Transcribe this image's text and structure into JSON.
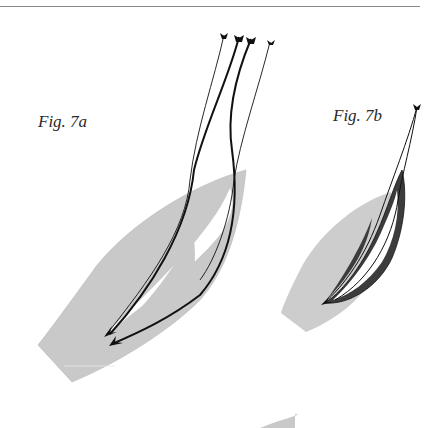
{
  "page": {
    "figures": [
      {
        "id": "7a",
        "label": "Fig. 7a",
        "description": "Boat hull outline (grey) with sail sheets/telltales shown as four curved lines with arrowheads"
      },
      {
        "id": "7b",
        "label": "Fig. 7b",
        "description": "Smaller boat hull outline (grey) with a dark-shaded sail and lines converging at the top"
      }
    ]
  },
  "colors": {
    "hull_fill": "#c8c8c8",
    "sail_dark": "#3a3a3a",
    "line": "#111111",
    "rule": "#8a8a8a"
  }
}
